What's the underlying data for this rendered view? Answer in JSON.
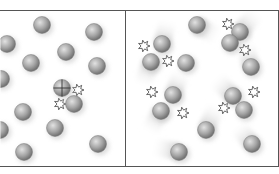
{
  "diagram": {
    "type": "particle-collision-illustration",
    "colors": {
      "background": "#ffffff",
      "border": "#555555",
      "ball_light": "#d6d6d6",
      "ball_dark": "#6e6e6e",
      "trail": "#c8c8c8",
      "burst": "#444444"
    },
    "panels": [
      {
        "name": "left-panel",
        "x": 0,
        "y": 10,
        "w": 125,
        "h": 157,
        "balls": [
          {
            "x": 42,
            "y": 25
          },
          {
            "x": 94,
            "y": 32
          },
          {
            "x": 7,
            "y": 44
          },
          {
            "x": 66,
            "y": 52
          },
          {
            "x": 31,
            "y": 63
          },
          {
            "x": 97,
            "y": 66
          },
          {
            "x": 1,
            "y": 79
          },
          {
            "x": 62,
            "y": 88,
            "marked": true
          },
          {
            "x": 74,
            "y": 104
          },
          {
            "x": 23,
            "y": 112
          },
          {
            "x": 55,
            "y": 128
          },
          {
            "x": 0,
            "y": 130
          },
          {
            "x": 24,
            "y": 152
          },
          {
            "x": 98,
            "y": 144
          }
        ],
        "bursts": [
          {
            "x": 78,
            "y": 90
          },
          {
            "x": 60,
            "y": 104
          }
        ],
        "trails": []
      },
      {
        "name": "right-panel",
        "x": 125,
        "y": 10,
        "w": 154,
        "h": 157,
        "balls": [
          {
            "x": 197,
            "y": 25
          },
          {
            "x": 240,
            "y": 32
          },
          {
            "x": 162,
            "y": 44
          },
          {
            "x": 230,
            "y": 43
          },
          {
            "x": 151,
            "y": 62
          },
          {
            "x": 186,
            "y": 63
          },
          {
            "x": 251,
            "y": 67
          },
          {
            "x": 173,
            "y": 95
          },
          {
            "x": 161,
            "y": 111
          },
          {
            "x": 233,
            "y": 96
          },
          {
            "x": 244,
            "y": 110
          },
          {
            "x": 206,
            "y": 130
          },
          {
            "x": 179,
            "y": 152
          },
          {
            "x": 252,
            "y": 144
          }
        ],
        "bursts": [
          {
            "x": 144,
            "y": 46
          },
          {
            "x": 168,
            "y": 61
          },
          {
            "x": 228,
            "y": 24
          },
          {
            "x": 245,
            "y": 50
          },
          {
            "x": 152,
            "y": 92
          },
          {
            "x": 183,
            "y": 113
          },
          {
            "x": 224,
            "y": 108
          },
          {
            "x": 254,
            "y": 92
          }
        ],
        "trails": [
          {
            "x": 197,
            "y": 25,
            "dx": 14,
            "dy": 8
          },
          {
            "x": 240,
            "y": 32,
            "dx": 12,
            "dy": -14
          },
          {
            "x": 162,
            "y": 44,
            "dx": 4,
            "dy": -16
          },
          {
            "x": 151,
            "y": 62,
            "dx": -6,
            "dy": 16
          },
          {
            "x": 251,
            "y": 67,
            "dx": -4,
            "dy": -16
          },
          {
            "x": 173,
            "y": 95,
            "dx": 6,
            "dy": -16
          },
          {
            "x": 161,
            "y": 111,
            "dx": -8,
            "dy": 14
          },
          {
            "x": 233,
            "y": 96,
            "dx": -12,
            "dy": -12
          },
          {
            "x": 206,
            "y": 130,
            "dx": 8,
            "dy": -18
          },
          {
            "x": 179,
            "y": 152,
            "dx": -18,
            "dy": -4
          },
          {
            "x": 252,
            "y": 144,
            "dx": -10,
            "dy": -12
          }
        ]
      }
    ]
  }
}
